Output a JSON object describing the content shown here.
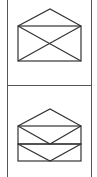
{
  "toolbar": {
    "buttons": [
      {
        "icon": "envelope-open-icon",
        "label": ""
      },
      {
        "icon": "envelope-stacked-icon",
        "label": ""
      }
    ]
  },
  "colors": {
    "stroke": "#333333",
    "border": "#555555",
    "background": "#ffffff"
  }
}
